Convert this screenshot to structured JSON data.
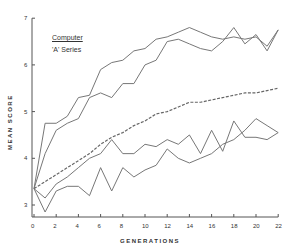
{
  "chart_data": {
    "type": "line",
    "title": "",
    "legend": [
      "Computer",
      "'A' Series"
    ],
    "xlabel": "GENERATIONS",
    "ylabel": "MEAN SCORE",
    "xlim": [
      0,
      22
    ],
    "ylim": [
      2.7,
      7
    ],
    "x_ticks": [
      0,
      2,
      4,
      6,
      8,
      10,
      12,
      14,
      16,
      18,
      20,
      22
    ],
    "y_ticks": [
      3,
      4,
      5,
      6,
      7
    ],
    "grid": false,
    "x": [
      0,
      1,
      2,
      3,
      4,
      5,
      6,
      7,
      8,
      9,
      10,
      11,
      12,
      13,
      14,
      15,
      16,
      17,
      18,
      19,
      20,
      21,
      22
    ],
    "series": [
      {
        "name": "upper-1",
        "style": "solid",
        "values": [
          3.35,
          4.75,
          4.75,
          4.9,
          5.3,
          5.35,
          5.9,
          6.05,
          6.1,
          6.3,
          6.35,
          6.55,
          6.6,
          6.7,
          6.8,
          6.7,
          6.6,
          6.55,
          6.6,
          6.55,
          6.6,
          6.4,
          6.75
        ]
      },
      {
        "name": "upper-2",
        "style": "solid",
        "values": [
          3.35,
          4.1,
          4.6,
          4.75,
          4.85,
          5.3,
          5.4,
          5.3,
          5.6,
          5.6,
          6.0,
          6.1,
          6.5,
          6.55,
          6.45,
          6.35,
          6.3,
          6.5,
          6.8,
          6.45,
          6.65,
          6.3,
          6.75
        ]
      },
      {
        "name": "mean",
        "style": "dashed",
        "values": [
          3.35,
          3.5,
          3.65,
          3.8,
          3.95,
          4.1,
          4.3,
          4.45,
          4.55,
          4.7,
          4.8,
          4.95,
          5.0,
          5.1,
          5.2,
          5.2,
          5.25,
          5.3,
          5.35,
          5.4,
          5.4,
          5.45,
          5.5
        ]
      },
      {
        "name": "lower-1",
        "style": "solid",
        "values": [
          3.35,
          3.15,
          3.45,
          3.6,
          3.8,
          4.0,
          4.1,
          4.4,
          4.1,
          4.1,
          4.3,
          4.25,
          4.4,
          4.3,
          4.5,
          4.1,
          4.6,
          4.15,
          4.8,
          4.45,
          4.45,
          4.4,
          4.55
        ]
      },
      {
        "name": "lower-2",
        "style": "solid",
        "values": [
          3.35,
          2.85,
          3.3,
          3.4,
          3.4,
          3.2,
          3.8,
          3.3,
          3.8,
          3.6,
          3.75,
          3.85,
          4.2,
          4.0,
          3.9,
          4.0,
          4.1,
          4.3,
          4.4,
          4.6,
          4.85,
          4.7,
          4.55
        ]
      }
    ]
  },
  "legend": {
    "line1": "Computer",
    "line2": "'A' Series"
  }
}
